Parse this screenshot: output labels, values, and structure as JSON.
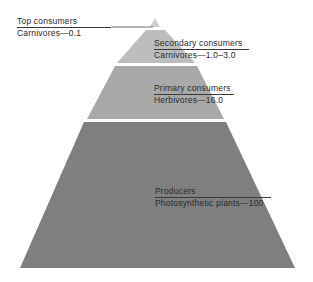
{
  "colors": {
    "top": "#d6d6d6",
    "secondary": "#bdbdbd",
    "primary": "#a9a9a9",
    "producers": "#7f7f7f",
    "gap": "#e9e9e9"
  },
  "tiers": [
    {
      "level": "Top consumers",
      "detail": "Carnivores—0.1"
    },
    {
      "level": "Secondary consumers",
      "detail": "Carnivores—1.0–3.0"
    },
    {
      "level": "Primary consumers",
      "detail": "Herbivores—16.0"
    },
    {
      "level": "Producers",
      "detail": "Photosynthetic plants—100"
    }
  ]
}
